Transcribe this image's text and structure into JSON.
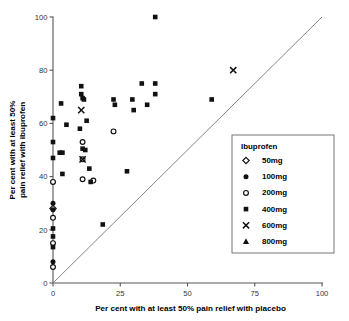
{
  "chart_data": {
    "type": "scatter",
    "title": "",
    "xlabel": "Per cent with at least 50% pain relief with placebo",
    "ylabel_line1": "Per cent with at least 50%",
    "ylabel_line2": "pain relief with ibuprofen",
    "xlim": [
      0,
      100
    ],
    "ylim": [
      0,
      100
    ],
    "xticks": [
      0,
      25,
      50,
      75,
      100
    ],
    "yticks": [
      0,
      20,
      40,
      60,
      80,
      100
    ],
    "grid": false,
    "reference_line": {
      "name": "line-of-equality",
      "from": [
        0,
        0
      ],
      "to": [
        100,
        100
      ]
    },
    "legend": {
      "title": "Ibuprofen",
      "position": "right",
      "entries": [
        {
          "label": "50mg",
          "marker": "open-diamond"
        },
        {
          "label": "100mg",
          "marker": "filled-circle"
        },
        {
          "label": "200mg",
          "marker": "open-circle"
        },
        {
          "label": "400mg",
          "marker": "filled-square"
        },
        {
          "label": "600mg",
          "marker": "cross"
        },
        {
          "label": "800mg",
          "marker": "filled-triangle"
        }
      ]
    },
    "series": [
      {
        "name": "50mg",
        "marker": "open-diamond",
        "points": [
          [
            0,
            28
          ]
        ]
      },
      {
        "name": "100mg",
        "marker": "filled-circle",
        "points": [
          [
            0,
            38
          ],
          [
            0,
            27.5
          ],
          [
            0,
            8
          ],
          [
            0,
            30
          ]
        ]
      },
      {
        "name": "200mg",
        "marker": "open-circle",
        "points": [
          [
            0,
            38
          ],
          [
            0,
            24.5
          ],
          [
            0,
            15
          ],
          [
            0,
            6
          ],
          [
            11,
            53
          ],
          [
            11,
            46.5
          ],
          [
            11,
            39
          ],
          [
            15,
            38.5
          ],
          [
            22.5,
            57
          ]
        ]
      },
      {
        "name": "400mg",
        "marker": "filled-square",
        "points": [
          [
            0,
            62
          ],
          [
            0,
            53
          ],
          [
            0,
            47
          ],
          [
            0,
            20.5
          ],
          [
            0,
            17.5
          ],
          [
            0,
            13.5
          ],
          [
            2.5,
            49
          ],
          [
            3.5,
            49
          ],
          [
            3,
            67.5
          ],
          [
            3.5,
            41
          ],
          [
            5,
            59.5
          ],
          [
            10.5,
            74
          ],
          [
            10.5,
            71
          ],
          [
            11,
            69.5
          ],
          [
            11.5,
            69
          ],
          [
            10,
            58
          ],
          [
            11,
            50.5
          ],
          [
            12,
            50
          ],
          [
            12.5,
            61
          ],
          [
            13.5,
            43
          ],
          [
            14,
            38
          ],
          [
            18.5,
            22
          ],
          [
            22.5,
            69
          ],
          [
            23,
            67
          ],
          [
            27.5,
            42
          ],
          [
            29.5,
            69
          ],
          [
            30,
            65
          ],
          [
            33,
            75
          ],
          [
            35,
            67
          ],
          [
            38,
            75
          ],
          [
            38,
            71
          ],
          [
            38,
            100
          ],
          [
            59,
            69
          ]
        ]
      },
      {
        "name": "600mg",
        "marker": "cross",
        "points": [
          [
            10.5,
            65
          ],
          [
            11,
            46.5
          ],
          [
            67,
            80
          ]
        ]
      },
      {
        "name": "800mg",
        "marker": "filled-triangle",
        "points": []
      }
    ]
  }
}
